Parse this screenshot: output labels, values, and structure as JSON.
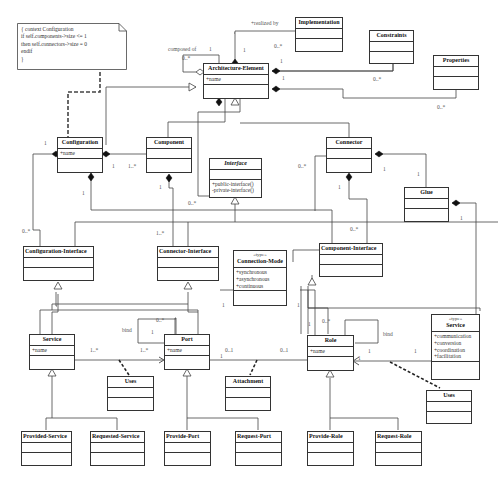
{
  "note": {
    "lines": [
      "{    context Configuration",
      "   if self.components->size <= 1",
      "     then self.connectors->size = 0",
      "   endif",
      "}"
    ]
  },
  "classes": {
    "implementation": {
      "name": "Implementation"
    },
    "constraints": {
      "name": "Constraints"
    },
    "properties": {
      "name": "Properties"
    },
    "architecture_element": {
      "name": "Architecture-Element",
      "attrs": "+name"
    },
    "configuration": {
      "name": "Configuration",
      "attrs": "+name"
    },
    "component": {
      "name": "Component"
    },
    "interface": {
      "name": "Interface",
      "ops": [
        "+public-interface()",
        "-private-interface()"
      ]
    },
    "connector": {
      "name": "Connector"
    },
    "glue": {
      "name": "Glue"
    },
    "configuration_interface": {
      "name": "Configuration-Interface"
    },
    "connector_interface": {
      "name": "Connector-Interface"
    },
    "component_interface": {
      "name": "Component-Interface"
    },
    "connection_mode": {
      "stereotype": "«type»",
      "name": "Connection-Mode",
      "attrs": [
        "+synchronous",
        "+asynchronous",
        "+continuous"
      ]
    },
    "service_type": {
      "stereotype": "«type»",
      "name": "Service",
      "attrs": [
        "+communication",
        "+conversion",
        "+coordination",
        "+facilitation"
      ]
    },
    "service": {
      "name": "Service",
      "attrs": "+name"
    },
    "port": {
      "name": "Port",
      "attrs": "+name"
    },
    "role": {
      "name": "Role",
      "attrs": "+name"
    },
    "uses_left": {
      "name": "Uses"
    },
    "attachment": {
      "name": "Attachment"
    },
    "uses_right": {
      "name": "Uses"
    },
    "provided_service": {
      "name": "Provided-Service"
    },
    "requested_service": {
      "name": "Requested-Service"
    },
    "provide_port": {
      "name": "Provide-Port"
    },
    "request_port": {
      "name": "Request-Port"
    },
    "provide_role": {
      "name": "Provide-Role"
    },
    "request_role": {
      "name": "Request-Role"
    }
  },
  "labels": {
    "realized_by": "+realized by",
    "composed_of": "composed of",
    "bind_port": "bind",
    "bind_role": "bind",
    "m_impl_1": "1",
    "m_impl_0n": "0..*",
    "m_impl_1b": "1",
    "m_comp_0n": "0..*",
    "m_comp_1": "1",
    "m_constr_1": "1",
    "m_constr_0n": "0..*",
    "m_prop_0n": "0..*",
    "m_cfg_1": "1",
    "m_cfg_comp_1": "1",
    "m_cfg_comp_1n": "1..*",
    "m_comp_down_1": "1",
    "m_cfg_down_1": "1",
    "m_iface_0n": "0..*",
    "m_conn_0n": "0..*",
    "m_conn_glue_1": "1",
    "m_glue_1": "1",
    "m_conn_down_1": "1",
    "m_ci_0n": "0..*",
    "m_cfgi_0n": "0..*",
    "m_coni_1n": "1..*",
    "m_glue_svc_1": "1",
    "m_port_self_0n": "0..*",
    "m_port_self_1": "1",
    "m_svc_1n": "1..*",
    "m_port_1n": "1..*",
    "m_port_01": "0..1",
    "m_port_1": "1",
    "m_role_01": "0..1",
    "m_role_1": "1",
    "m_cm_1a": "1",
    "m_cm_1b": "1",
    "m_role_top_1": "1",
    "m_role_top_0n": "0..*",
    "m_role_svc_1": "1",
    "m_role_svc_1b": "1",
    "m_svc_1": "1"
  }
}
